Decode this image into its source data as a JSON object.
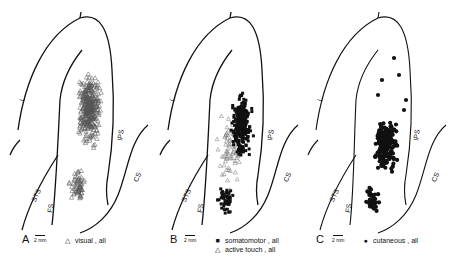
{
  "figure": {
    "panels": [
      {
        "letter": "A",
        "scale_label": "2 mm",
        "legend": [
          {
            "symbol": "△",
            "marker": "open-triangle",
            "label": "visual , all"
          }
        ],
        "sulci": {
          "L": "L",
          "IPS": "IPS",
          "STS": "STS",
          "FS": "FS",
          "CS": "CS"
        }
      },
      {
        "letter": "B",
        "scale_label": "2 mm",
        "legend": [
          {
            "symbol": "■",
            "marker": "filled-square",
            "label": "somatomotor , all"
          },
          {
            "symbol": "△",
            "marker": "open-triangle",
            "label": "active touch , all"
          }
        ],
        "sulci": {
          "L": "L",
          "IPS": "IPS",
          "STS": "STS",
          "FS": "FS",
          "CS": "CS"
        }
      },
      {
        "letter": "C",
        "scale_label": "2 mm",
        "legend": [
          {
            "symbol": "●",
            "marker": "filled-circle",
            "label": "cutaneous , all"
          }
        ],
        "sulci": {
          "L": "L",
          "IPS": "IPS",
          "STS": "STS",
          "FS": "FS",
          "CS": "CS"
        }
      }
    ]
  }
}
